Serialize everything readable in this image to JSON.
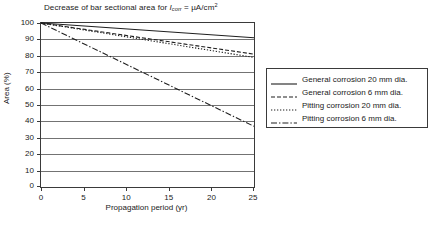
{
  "chart_data": {
    "type": "line",
    "title_parts": {
      "lead": "Decrease of bar sectional area for ",
      "symbol": "I",
      "symbol_sub": "corr",
      "tail_pre": " = µA/cm",
      "tail_sup": "2"
    },
    "xlabel": "Propagation period (yr)",
    "ylabel": "Area (%)",
    "xlim": [
      0,
      25
    ],
    "ylim": [
      0,
      100
    ],
    "xticks": [
      0,
      5,
      10,
      15,
      20,
      25
    ],
    "yticks": [
      0,
      10,
      20,
      30,
      40,
      50,
      60,
      70,
      80,
      90,
      100
    ],
    "grid": "horizontal",
    "legend_position": "right",
    "series": [
      {
        "name": "General corrosion 20 mm dia.",
        "style": "solid",
        "x": [
          0,
          25
        ],
        "values": [
          100,
          91
        ]
      },
      {
        "name": "General corrosion 6 mm dia.",
        "style": "dashed",
        "x": [
          0,
          25
        ],
        "values": [
          100,
          81
        ]
      },
      {
        "name": "Pitting corrosion 20 mm dia.",
        "style": "dotted",
        "x": [
          0,
          25
        ],
        "values": [
          100,
          79
        ]
      },
      {
        "name": "Pitting corrosion 6 mm dia.",
        "style": "dashdot",
        "x": [
          0,
          25
        ],
        "values": [
          100,
          37
        ]
      }
    ]
  },
  "colors": {
    "line": "#1f1f1f",
    "grid": "#737373",
    "frame": "#3a3a3a",
    "background": "#ffffff"
  }
}
